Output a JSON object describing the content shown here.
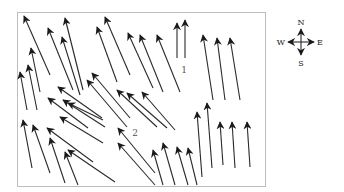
{
  "diagram": {
    "type": "vector-field",
    "frame": {
      "x": 17,
      "y": 12,
      "width": 248,
      "height": 174
    },
    "colors": {
      "arrow": "#1a1a1a",
      "frame": "#bdbdbd",
      "label": "#555555"
    },
    "labels": [
      {
        "id": "region-1",
        "text": "1",
        "x": 184,
        "y": 73
      },
      {
        "id": "region-2",
        "text": "2",
        "x": 135,
        "y": 136
      }
    ],
    "compass": {
      "center": {
        "x": 301,
        "y": 42
      },
      "north": "N",
      "south": "S",
      "east": "E",
      "west": "W"
    },
    "arrows": [
      {
        "x1": 50,
        "y1": 75,
        "x2": 24,
        "y2": 16
      },
      {
        "x1": 83,
        "y1": 90,
        "x2": 65,
        "y2": 18
      },
      {
        "x1": 73,
        "y1": 90,
        "x2": 48,
        "y2": 28
      },
      {
        "x1": 80,
        "y1": 95,
        "x2": 62,
        "y2": 37
      },
      {
        "x1": 40,
        "y1": 92,
        "x2": 31,
        "y2": 48
      },
      {
        "x1": 37,
        "y1": 110,
        "x2": 28,
        "y2": 65
      },
      {
        "x1": 27,
        "y1": 110,
        "x2": 20,
        "y2": 72
      },
      {
        "x1": 130,
        "y1": 75,
        "x2": 105,
        "y2": 17
      },
      {
        "x1": 117,
        "y1": 82,
        "x2": 97,
        "y2": 27
      },
      {
        "x1": 153,
        "y1": 88,
        "x2": 128,
        "y2": 33
      },
      {
        "x1": 163,
        "y1": 92,
        "x2": 140,
        "y2": 35
      },
      {
        "x1": 180,
        "y1": 92,
        "x2": 157,
        "y2": 35
      },
      {
        "x1": 177,
        "y1": 58,
        "x2": 177,
        "y2": 23
      },
      {
        "x1": 185,
        "y1": 58,
        "x2": 185,
        "y2": 20
      },
      {
        "x1": 213,
        "y1": 100,
        "x2": 203,
        "y2": 35
      },
      {
        "x1": 225,
        "y1": 100,
        "x2": 217,
        "y2": 38
      },
      {
        "x1": 240,
        "y1": 100,
        "x2": 230,
        "y2": 38
      },
      {
        "x1": 102,
        "y1": 118,
        "x2": 58,
        "y2": 87
      },
      {
        "x1": 88,
        "y1": 128,
        "x2": 48,
        "y2": 98
      },
      {
        "x1": 105,
        "y1": 127,
        "x2": 63,
        "y2": 100
      },
      {
        "x1": 103,
        "y1": 120,
        "x2": 68,
        "y2": 103
      },
      {
        "x1": 103,
        "y1": 143,
        "x2": 60,
        "y2": 117
      },
      {
        "x1": 130,
        "y1": 118,
        "x2": 92,
        "y2": 73
      },
      {
        "x1": 127,
        "y1": 127,
        "x2": 87,
        "y2": 80
      },
      {
        "x1": 157,
        "y1": 127,
        "x2": 117,
        "y2": 90
      },
      {
        "x1": 167,
        "y1": 128,
        "x2": 127,
        "y2": 93
      },
      {
        "x1": 175,
        "y1": 130,
        "x2": 142,
        "y2": 92
      },
      {
        "x1": 32,
        "y1": 168,
        "x2": 23,
        "y2": 120
      },
      {
        "x1": 50,
        "y1": 173,
        "x2": 33,
        "y2": 125
      },
      {
        "x1": 93,
        "y1": 162,
        "x2": 47,
        "y2": 128
      },
      {
        "x1": 65,
        "y1": 183,
        "x2": 50,
        "y2": 138
      },
      {
        "x1": 78,
        "y1": 185,
        "x2": 65,
        "y2": 152
      },
      {
        "x1": 115,
        "y1": 182,
        "x2": 68,
        "y2": 150
      },
      {
        "x1": 155,
        "y1": 173,
        "x2": 118,
        "y2": 128
      },
      {
        "x1": 155,
        "y1": 185,
        "x2": 118,
        "y2": 143
      },
      {
        "x1": 163,
        "y1": 185,
        "x2": 153,
        "y2": 150
      },
      {
        "x1": 175,
        "y1": 185,
        "x2": 163,
        "y2": 143
      },
      {
        "x1": 188,
        "y1": 185,
        "x2": 177,
        "y2": 147
      },
      {
        "x1": 197,
        "y1": 185,
        "x2": 188,
        "y2": 148
      },
      {
        "x1": 202,
        "y1": 177,
        "x2": 197,
        "y2": 112
      },
      {
        "x1": 212,
        "y1": 168,
        "x2": 207,
        "y2": 103
      },
      {
        "x1": 223,
        "y1": 165,
        "x2": 220,
        "y2": 122
      },
      {
        "x1": 235,
        "y1": 168,
        "x2": 232,
        "y2": 122
      },
      {
        "x1": 250,
        "y1": 167,
        "x2": 247,
        "y2": 122
      }
    ]
  }
}
